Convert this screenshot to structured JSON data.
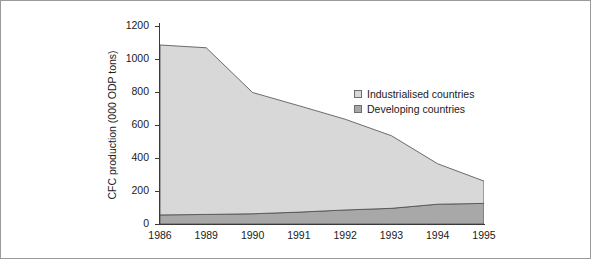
{
  "chart_data": {
    "type": "area",
    "stacked": true,
    "title": "",
    "xlabel": "",
    "ylabel": "CFC production (000 ODP tons)",
    "categories": [
      "1986",
      "1989",
      "1990",
      "1991",
      "1992",
      "1993",
      "1994",
      "1995"
    ],
    "xtick_labels": [
      "1986",
      "1989",
      "1990",
      "1991",
      "1992",
      "1993",
      "1994",
      "1995"
    ],
    "ytick_labels": [
      "0",
      "200",
      "400",
      "600",
      "800",
      "1000",
      "1200"
    ],
    "ytick_values": [
      0,
      200,
      400,
      600,
      800,
      1000,
      1200
    ],
    "ylim": [
      0,
      1200
    ],
    "grid": false,
    "legend_position": "inside-right",
    "series": [
      {
        "name": "Industrialised countries",
        "color": "#d8d8d8",
        "values": [
          1030,
          1010,
          735,
          645,
          550,
          440,
          245,
          135
        ]
      },
      {
        "name": "Developing countries",
        "color": "#a8a8a8",
        "values": [
          55,
          58,
          62,
          72,
          85,
          95,
          120,
          125
        ]
      }
    ],
    "totals": [
      1085,
      1068,
      797,
      717,
      635,
      535,
      365,
      260
    ],
    "annotations": []
  },
  "legend": {
    "items": [
      {
        "label": "Industrialised countries",
        "color": "#d8d8d8"
      },
      {
        "label": "Developing countries",
        "color": "#a8a8a8"
      }
    ]
  },
  "colors": {
    "frame": "#9a9a9a",
    "axis": "#3a3a3a",
    "industrialised": "#d8d8d8",
    "developing": "#a8a8a8",
    "outline": "#4a4a4a",
    "background": "#ffffff"
  }
}
